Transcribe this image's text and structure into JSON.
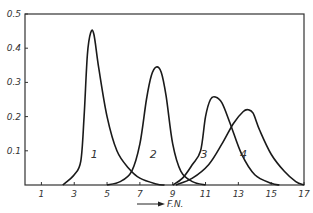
{
  "chart_data": {
    "type": "line",
    "title": "",
    "xlabel": "F.N.",
    "ylabel": "",
    "xlim": [
      0,
      17
    ],
    "ylim": [
      0,
      0.5
    ],
    "x_ticks": [
      1,
      3,
      5,
      7,
      9,
      11,
      13,
      15,
      17
    ],
    "y_ticks": [
      0.1,
      0.2,
      0.3,
      0.4,
      0.5
    ],
    "y_tick_labels": [
      "0.1",
      "0.2",
      "0.3",
      "0.4",
      "0.5"
    ],
    "grid": false,
    "legend": "curve labels inline",
    "series": [
      {
        "name": "1",
        "label_pos": [
          4.0,
          0.08
        ],
        "points": [
          [
            2.3,
            0
          ],
          [
            3.0,
            0.03
          ],
          [
            3.4,
            0.07
          ],
          [
            3.6,
            0.2
          ],
          [
            3.8,
            0.38
          ],
          [
            4.0,
            0.445
          ],
          [
            4.2,
            0.44
          ],
          [
            4.5,
            0.34
          ],
          [
            5.0,
            0.2
          ],
          [
            5.6,
            0.1
          ],
          [
            6.3,
            0.05
          ],
          [
            7.0,
            0.02
          ],
          [
            8.0,
            0.003
          ],
          [
            8.5,
            0
          ]
        ]
      },
      {
        "name": "2",
        "label_pos": [
          7.6,
          0.08
        ],
        "points": [
          [
            5.0,
            0
          ],
          [
            5.8,
            0.01
          ],
          [
            6.5,
            0.04
          ],
          [
            7.0,
            0.12
          ],
          [
            7.4,
            0.25
          ],
          [
            7.7,
            0.32
          ],
          [
            8.0,
            0.345
          ],
          [
            8.3,
            0.33
          ],
          [
            8.6,
            0.26
          ],
          [
            9.0,
            0.12
          ],
          [
            9.5,
            0.04
          ],
          [
            10.2,
            0.01
          ],
          [
            11.0,
            0
          ]
        ]
      },
      {
        "name": "3",
        "label_pos": [
          10.7,
          0.08
        ],
        "points": [
          [
            9.0,
            0
          ],
          [
            9.6,
            0.02
          ],
          [
            10.2,
            0.06
          ],
          [
            10.7,
            0.1
          ],
          [
            11.0,
            0.2
          ],
          [
            11.3,
            0.25
          ],
          [
            11.6,
            0.257
          ],
          [
            12.0,
            0.24
          ],
          [
            12.5,
            0.18
          ],
          [
            13.2,
            0.09
          ],
          [
            14.0,
            0.03
          ],
          [
            15.0,
            0.005
          ],
          [
            15.5,
            0
          ]
        ]
      },
      {
        "name": "4",
        "label_pos": [
          13.1,
          0.08
        ],
        "points": [
          [
            9.2,
            0
          ],
          [
            10.2,
            0.02
          ],
          [
            11.2,
            0.06
          ],
          [
            12.0,
            0.12
          ],
          [
            12.7,
            0.18
          ],
          [
            13.3,
            0.215
          ],
          [
            13.6,
            0.22
          ],
          [
            13.9,
            0.21
          ],
          [
            14.3,
            0.16
          ],
          [
            15.0,
            0.09
          ],
          [
            15.8,
            0.04
          ],
          [
            16.5,
            0.01
          ],
          [
            17.0,
            0
          ]
        ]
      }
    ]
  }
}
